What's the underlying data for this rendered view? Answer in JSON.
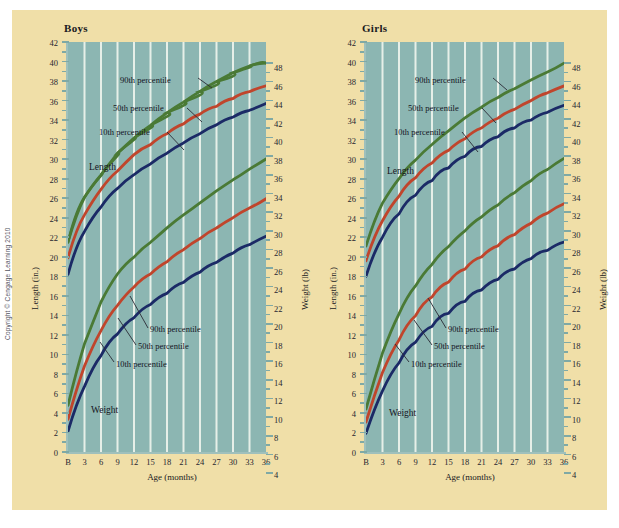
{
  "figure": {
    "copyright": "Copyright © Cengage Learning 2010",
    "background_color": "#f0dfa8",
    "plot_background_color": "#8cb6b2",
    "gridline_color": "#e6efe8"
  },
  "colors": {
    "p90": "#4a7a35",
    "p50": "#c0452c",
    "p10": "#1b2a66"
  },
  "panels": [
    {
      "id": "boys",
      "title": "Boys",
      "annotations": {
        "length_group": "Length",
        "weight_group": "Weight",
        "length_p90": "90th percentile",
        "length_p50": "50th percentile",
        "length_p10": "10th percentile",
        "weight_p90": "90th percentile",
        "weight_p50": "50th percentile",
        "weight_p10": "10th percentile"
      }
    },
    {
      "id": "girls",
      "title": "Girls",
      "annotations": {
        "length_group": "Length",
        "weight_group": "Weight",
        "length_p90": "90th percentile",
        "length_p50": "50th percentile",
        "length_p10": "10th percentile",
        "weight_p90": "90th percentile",
        "weight_p50": "50th percentile",
        "weight_p10": "10th percentile"
      }
    }
  ],
  "axes": {
    "x_title": "Age (months)",
    "y_left_title": "Length (in.)",
    "y_right_title": "Weight (lb)",
    "x_ticks": [
      "B",
      "3",
      "6",
      "9",
      "12",
      "15",
      "18",
      "21",
      "24",
      "27",
      "30",
      "33",
      "36"
    ],
    "y_left_ticks": [
      "42",
      "40",
      "38",
      "36",
      "34",
      "32",
      "30",
      "28",
      "26",
      "24",
      "22",
      "20",
      "18",
      "16",
      "14",
      "12",
      "10",
      "8",
      "6",
      "4",
      "2",
      "0"
    ],
    "y_right_ticks": [
      "48",
      "46",
      "44",
      "42",
      "40",
      "38",
      "36",
      "34",
      "32",
      "30",
      "28",
      "26",
      "24",
      "22",
      "20",
      "18",
      "16",
      "14",
      "12",
      "10",
      "8",
      "6",
      "4"
    ]
  },
  "chart_data": {
    "type": "line",
    "xlabel": "Age (months)",
    "ylabel": "Length (in.)",
    "ylabel_right": "Weight (lb)",
    "x": [
      0,
      3,
      6,
      9,
      12,
      15,
      18,
      21,
      24,
      27,
      30,
      33,
      36
    ],
    "x_tick_labels": [
      "B",
      "3",
      "6",
      "9",
      "12",
      "15",
      "18",
      "21",
      "24",
      "27",
      "30",
      "33",
      "36"
    ],
    "xlim": [
      0,
      36
    ],
    "ylim_left": [
      0,
      42
    ],
    "ylim_right": [
      4,
      48
    ],
    "grid": "vertical",
    "legend": "inline-annotations",
    "panels": [
      {
        "name": "Boys",
        "series": [
          {
            "name": "Length 90th percentile",
            "group": "Length",
            "percentile": 90,
            "axis": "left",
            "unit": "in.",
            "color": "#4a7a35",
            "values": [
              21.5,
              26.1,
              28.6,
              30.6,
              32.2,
              33.5,
              34.7,
              35.8,
              36.8,
              37.7,
              38.5,
              39.2,
              39.8
            ]
          },
          {
            "name": "Length 50th percentile",
            "group": "Length",
            "percentile": 50,
            "axis": "left",
            "unit": "in.",
            "color": "#c0452c",
            "values": [
              19.9,
              24.3,
              26.9,
              28.8,
              30.2,
              31.5,
              32.6,
              33.6,
              34.6,
              35.4,
              36.2,
              36.9,
              37.6
            ]
          },
          {
            "name": "Length 10th percentile",
            "group": "Length",
            "percentile": 10,
            "axis": "left",
            "unit": "in.",
            "color": "#1b2a66",
            "values": [
              18.2,
              22.6,
              25.1,
              27.0,
              28.4,
              29.6,
              30.7,
              31.7,
              32.6,
              33.5,
              34.3,
              35.0,
              35.7
            ]
          },
          {
            "name": "Weight 90th percentile",
            "group": "Weight",
            "percentile": 90,
            "axis": "right",
            "unit": "lb",
            "color": "#4a7a35",
            "values": [
              9.0,
              16.0,
              20.5,
              23.5,
              25.8,
              27.6,
              29.2,
              30.7,
              32.0,
              33.3,
              34.5,
              35.6,
              36.7
            ]
          },
          {
            "name": "Weight 50th percentile",
            "group": "Weight",
            "percentile": 50,
            "axis": "right",
            "unit": "lb",
            "color": "#c0452c",
            "values": [
              7.5,
              13.5,
              17.3,
              20.0,
              22.0,
              23.6,
              25.0,
              26.3,
              27.5,
              28.6,
              29.7,
              30.7,
              31.7
            ]
          },
          {
            "name": "Weight 10th percentile",
            "group": "Weight",
            "percentile": 10,
            "axis": "right",
            "unit": "lb",
            "color": "#1b2a66",
            "values": [
              6.2,
              11.3,
              14.6,
              16.9,
              18.6,
              20.0,
              21.2,
              22.3,
              23.4,
              24.4,
              25.4,
              26.3,
              27.2
            ]
          }
        ]
      },
      {
        "name": "Girls",
        "series": [
          {
            "name": "Length 90th percentile",
            "group": "Length",
            "percentile": 90,
            "axis": "left",
            "unit": "in.",
            "color": "#4a7a35",
            "values": [
              21.1,
              25.5,
              28.0,
              29.9,
              31.5,
              32.9,
              34.2,
              35.3,
              36.4,
              37.3,
              38.2,
              39.0,
              39.8
            ]
          },
          {
            "name": "Length 50th percentile",
            "group": "Length",
            "percentile": 50,
            "axis": "left",
            "unit": "in.",
            "color": "#c0452c",
            "values": [
              19.6,
              23.7,
              26.2,
              28.1,
              29.6,
              30.9,
              32.1,
              33.2,
              34.2,
              35.1,
              36.0,
              36.8,
              37.6
            ]
          },
          {
            "name": "Length 10th percentile",
            "group": "Length",
            "percentile": 10,
            "axis": "left",
            "unit": "in.",
            "color": "#1b2a66",
            "values": [
              18.0,
              22.0,
              24.4,
              26.3,
              27.8,
              29.1,
              30.3,
              31.3,
              32.3,
              33.2,
              34.0,
              34.8,
              35.5
            ]
          },
          {
            "name": "Weight 90th percentile",
            "group": "Weight",
            "percentile": 90,
            "axis": "right",
            "unit": "lb",
            "color": "#4a7a35",
            "values": [
              8.6,
              15.0,
              19.2,
              22.2,
              24.5,
              26.4,
              28.1,
              29.6,
              31.0,
              32.3,
              33.6,
              34.8,
              36.0
            ]
          },
          {
            "name": "Weight 50th percentile",
            "group": "Weight",
            "percentile": 50,
            "axis": "right",
            "unit": "lb",
            "color": "#c0452c",
            "values": [
              7.2,
              12.7,
              16.2,
              18.8,
              20.8,
              22.4,
              23.8,
              25.1,
              26.3,
              27.5,
              28.6,
              29.7,
              30.7
            ]
          },
          {
            "name": "Weight 10th percentile",
            "group": "Weight",
            "percentile": 10,
            "axis": "right",
            "unit": "lb",
            "color": "#1b2a66",
            "values": [
              6.0,
              10.6,
              13.6,
              15.8,
              17.5,
              18.9,
              20.1,
              21.2,
              22.2,
              23.2,
              24.1,
              25.0,
              25.9
            ]
          }
        ]
      }
    ]
  }
}
